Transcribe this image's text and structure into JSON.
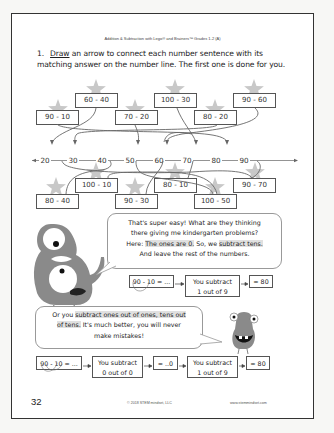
{
  "header": {
    "title": "Addition & Subtraction with Lego® and Brainers™ Grades 1-2 (A)"
  },
  "instruction": {
    "number": "1.",
    "verb": "Draw",
    "text_line1_rest": " an arrow to connect each number sentence with its",
    "text_line2": "matching answer on the number line. The first one is done for you."
  },
  "top_sentences": [
    {
      "label": "90 - 10"
    },
    {
      "label": "60 - 40"
    },
    {
      "label": "70 - 20"
    },
    {
      "label": "100 - 30"
    },
    {
      "label": "80 - 20"
    },
    {
      "label": "90 - 60"
    }
  ],
  "number_line": {
    "ticks": [
      "20",
      "30",
      "40",
      "50",
      "60",
      "70",
      "80",
      "90"
    ]
  },
  "bottom_sentences": [
    {
      "label": "80 - 40"
    },
    {
      "label": "100 - 10"
    },
    {
      "label": "90 - 30"
    },
    {
      "label": "80 - 10"
    },
    {
      "label": "100 - 50"
    },
    {
      "label": "90 - 70"
    }
  ],
  "bubble1": {
    "line1": "That's super easy! What are they thinking",
    "line2": "there giving me kindergarten problems?",
    "line3_pre": "Here: ",
    "line3_hl1": "The ones are 0.",
    "line3_mid": " So, we ",
    "line3_hl2": "subtract tens.",
    "line4": "And leave the rest of the numbers."
  },
  "flow1": {
    "start": "90 - 10 = ...",
    "step": "You subtract\n1 out of 9",
    "step_line1": "You subtract",
    "step_line2": "1 out of 9",
    "result": "= 80"
  },
  "bubble2": {
    "line1_pre": "Or you ",
    "line1_hl": "subtract ones out of ones, tens out",
    "line2_hl": "of tens.",
    "line2_rest": " It's much better, you will never",
    "line3": "make mistakes!"
  },
  "flow2": {
    "start": "90 - 10 = ...",
    "step1_line1": "You subtract",
    "step1_line2": "0 out of 0",
    "mid": "= ..0",
    "step2_line1": "You subtract",
    "step2_line2": "1 out of 9",
    "result": "= 80"
  },
  "footer": {
    "page_number": "32",
    "copyright": "© 2018 STEM mindset, LLC",
    "url": "www.stemmindset.com"
  },
  "colors": {
    "star": "#c8c8c8",
    "monster": "#8a8a8a",
    "highlight": "#e0e0e0",
    "border": "#333333"
  }
}
